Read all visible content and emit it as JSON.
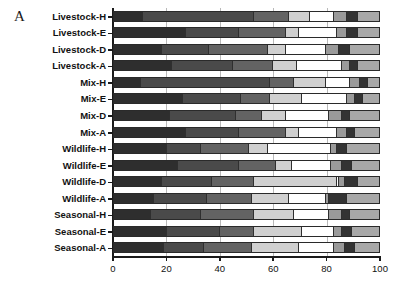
{
  "figure": {
    "panel_letter": "A"
  },
  "chart_data": {
    "type": "bar",
    "orientation": "horizontal",
    "stacked": true,
    "title": "",
    "xlabel": "",
    "ylabel": "",
    "xlim": [
      0,
      100
    ],
    "xticks": [
      0,
      20,
      40,
      60,
      80,
      100
    ],
    "xtick_labels": [
      "0",
      "20",
      "40",
      "60",
      "80",
      "100"
    ],
    "grid": "vertical gridlines at 20, 40, 60, 80",
    "legend": "none",
    "series": [
      {
        "name": "S1",
        "color": "#2e2e2e"
      },
      {
        "name": "S2",
        "color": "#4a4a4a"
      },
      {
        "name": "S3",
        "color": "#636363"
      },
      {
        "name": "S4",
        "color": "#d0d0d0"
      },
      {
        "name": "S5",
        "color": "#ffffff"
      },
      {
        "name": "S6",
        "color": "#9a9a9a"
      },
      {
        "name": "S7",
        "color": "#333333"
      },
      {
        "name": "S8",
        "color": "#a8a8a8"
      }
    ],
    "categories": [
      "Livestock-H",
      "Livestock-E",
      "Livestock-D",
      "Livestock-A",
      "Mix-H",
      "Mix-E",
      "Mix-D",
      "Mix-A",
      "Wildlife-H",
      "Wildlife-E",
      "Wildlife-D",
      "Wildlife-A",
      "Seasonal-H",
      "Seasonal-E",
      "Seasonal-A"
    ],
    "rows": [
      {
        "category": "Livestock-H",
        "values": [
          11,
          42,
          13,
          8,
          9,
          5,
          4,
          8
        ]
      },
      {
        "category": "Livestock-E",
        "values": [
          27,
          20,
          18,
          5,
          14,
          4,
          4,
          8
        ]
      },
      {
        "category": "Livestock-D",
        "values": [
          18,
          18,
          22,
          7,
          15,
          5,
          4,
          11
        ]
      },
      {
        "category": "Livestock-A",
        "values": [
          22,
          23,
          15,
          9,
          17,
          3,
          3,
          8
        ]
      },
      {
        "category": "Mix-H",
        "values": [
          10,
          49,
          9,
          12,
          9,
          4,
          3,
          4
        ]
      },
      {
        "category": "Mix-E",
        "values": [
          26,
          22,
          11,
          12,
          17,
          3,
          3,
          6
        ]
      },
      {
        "category": "Mix-D",
        "values": [
          21,
          25,
          10,
          9,
          16,
          5,
          3,
          11
        ]
      },
      {
        "category": "Mix-A",
        "values": [
          27,
          20,
          18,
          5,
          14,
          4,
          3,
          9
        ]
      },
      {
        "category": "Wildlife-H",
        "values": [
          20,
          13,
          18,
          7,
          24,
          2,
          4,
          12
        ]
      },
      {
        "category": "Wildlife-E",
        "values": [
          24,
          23,
          14,
          6,
          15,
          4,
          4,
          10
        ]
      },
      {
        "category": "Wildlife-D",
        "values": [
          18,
          19,
          16,
          31,
          1,
          2,
          5,
          8
        ]
      },
      {
        "category": "Wildlife-A",
        "values": [
          15,
          20,
          17,
          14,
          14,
          1,
          7,
          12
        ]
      },
      {
        "category": "Seasonal-H",
        "values": [
          14,
          19,
          20,
          15,
          13,
          5,
          3,
          11
        ]
      },
      {
        "category": "Seasonal-E",
        "values": [
          20,
          20,
          13,
          18,
          12,
          3,
          4,
          10
        ]
      },
      {
        "category": "Seasonal-A",
        "values": [
          19,
          15,
          18,
          18,
          13,
          4,
          4,
          9
        ]
      }
    ]
  }
}
